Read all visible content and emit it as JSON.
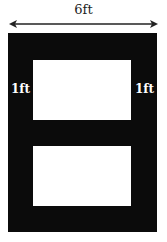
{
  "diagram": {
    "width_label": "6ft",
    "left_border_label": "1ft",
    "right_border_label": "1ft",
    "colors": {
      "frame": "#0b0b0b",
      "window": "#ffffff",
      "arrow": "#222222"
    }
  }
}
